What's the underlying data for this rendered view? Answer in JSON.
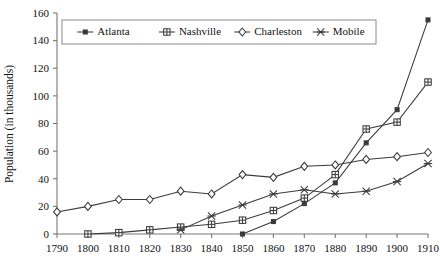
{
  "chart_data": {
    "type": "line",
    "title": "",
    "xlabel": "",
    "ylabel": "Population (in thousands)",
    "x": [
      1790,
      1800,
      1810,
      1820,
      1830,
      1840,
      1850,
      1860,
      1870,
      1880,
      1890,
      1900,
      1910
    ],
    "categories": [
      "1790",
      "1800",
      "1810",
      "1820",
      "1830",
      "1840",
      "1850",
      "1860",
      "1870",
      "1880",
      "1890",
      "1900",
      "1910"
    ],
    "xlim": [
      1790,
      1910
    ],
    "ylim": [
      0,
      160
    ],
    "y_ticks": [
      0,
      20,
      40,
      60,
      80,
      100,
      120,
      140,
      160
    ],
    "y_tick_labels": [
      "0",
      "20",
      "40",
      "60",
      "80",
      "100",
      "120",
      "140",
      "160"
    ],
    "x_ticks": [
      1790,
      1800,
      1810,
      1820,
      1830,
      1840,
      1850,
      1860,
      1870,
      1880,
      1890,
      1900,
      1910
    ],
    "x_tick_labels": [
      "1790",
      "1800",
      "1810",
      "1820",
      "1830",
      "1840",
      "1850",
      "1860",
      "1870",
      "1880",
      "1890",
      "1900",
      "1910"
    ],
    "grid": false,
    "legend_position": "top-center",
    "series": [
      {
        "name": "Atlanta",
        "marker": "filled-square",
        "x": [
          1850,
          1860,
          1870,
          1880,
          1890,
          1900,
          1910
        ],
        "values": [
          0,
          9,
          22,
          37,
          66,
          90,
          155
        ]
      },
      {
        "name": "Nashville",
        "marker": "crossed-square",
        "x": [
          1800,
          1810,
          1820,
          1830,
          1840,
          1850,
          1860,
          1870,
          1880,
          1890,
          1900,
          1910
        ],
        "values": [
          0,
          1,
          3,
          5,
          7,
          10,
          17,
          26,
          43,
          76,
          81,
          110
        ]
      },
      {
        "name": "Charleston",
        "marker": "diamond",
        "x": [
          1790,
          1800,
          1810,
          1820,
          1830,
          1840,
          1850,
          1860,
          1870,
          1880,
          1890,
          1900,
          1910
        ],
        "values": [
          16,
          20,
          25,
          25,
          31,
          29,
          43,
          41,
          49,
          50,
          54,
          56,
          59
        ]
      },
      {
        "name": "Mobile",
        "marker": "asterisk",
        "x": [
          1830,
          1840,
          1850,
          1860,
          1870,
          1880,
          1890,
          1900,
          1910
        ],
        "values": [
          3,
          13,
          21,
          29,
          32,
          29,
          31,
          38,
          51
        ]
      }
    ]
  },
  "legend": {
    "entries": [
      {
        "label": "Atlanta",
        "marker": "filled-square"
      },
      {
        "label": "Nashville",
        "marker": "crossed-square"
      },
      {
        "label": "Charleston",
        "marker": "diamond"
      },
      {
        "label": "Mobile",
        "marker": "asterisk"
      }
    ]
  }
}
